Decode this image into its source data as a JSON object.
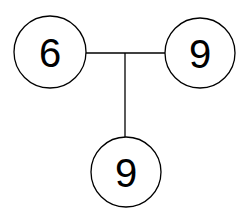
{
  "diagram": {
    "type": "tree",
    "nodes": [
      {
        "id": "left",
        "label": "6",
        "cx": 50,
        "cy": 52,
        "r": 36
      },
      {
        "id": "right",
        "label": "9",
        "cx": 200,
        "cy": 53,
        "r": 35
      },
      {
        "id": "bottom",
        "label": "9",
        "cx": 126,
        "cy": 172,
        "r": 35
      }
    ],
    "edges": [
      {
        "from": "left",
        "to": "right",
        "x1": 86,
        "y1": 53,
        "x2": 165,
        "y2": 53
      },
      {
        "from": "junction",
        "to": "bottom",
        "x1": 125,
        "y1": 53,
        "x2": 125,
        "y2": 137
      }
    ],
    "colors": {
      "stroke": "#000000",
      "fill": "#ffffff",
      "text": "#000000"
    }
  }
}
